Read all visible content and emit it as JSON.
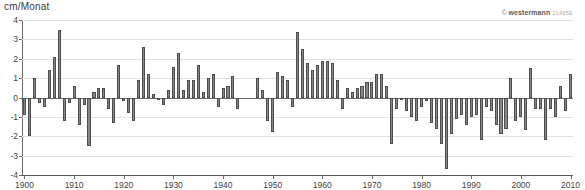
{
  "chart": {
    "y_axis_title": "cm/Monat",
    "copyright_symbol": "©",
    "copyright_brand": "westermann",
    "copyright_code": "21495E"
  },
  "chart_data": {
    "type": "bar",
    "title": "",
    "subtitle": "",
    "xlabel": "",
    "ylabel": "cm/Monat",
    "ylim": [
      -4,
      4
    ],
    "xlim": [
      1900,
      2010
    ],
    "grid": true,
    "legend": null,
    "y_ticks": [
      4,
      3,
      2,
      1,
      0,
      -1,
      -2,
      -3,
      -4
    ],
    "y_tick_labels": [
      "4",
      "3",
      "2",
      "1",
      "0",
      "-1",
      "-2",
      "-3",
      "-4"
    ],
    "x_ticks": [
      1900,
      1910,
      1920,
      1930,
      1940,
      1950,
      1960,
      1970,
      1980,
      1990,
      2000,
      2010
    ],
    "x_tick_labels": [
      "1900",
      "1910",
      "1920",
      "1930",
      "1940",
      "1950",
      "1960",
      "1970",
      "1980",
      "1990",
      "2000",
      "2010"
    ],
    "bar_color": "#878787",
    "bar_edge_color": "#4d4d4d",
    "categories": [
      1900,
      1901,
      1902,
      1903,
      1904,
      1905,
      1906,
      1907,
      1908,
      1909,
      1910,
      1911,
      1912,
      1913,
      1914,
      1915,
      1916,
      1917,
      1918,
      1919,
      1920,
      1921,
      1922,
      1923,
      1924,
      1925,
      1926,
      1927,
      1928,
      1929,
      1930,
      1931,
      1932,
      1933,
      1934,
      1935,
      1936,
      1937,
      1938,
      1939,
      1940,
      1941,
      1942,
      1943,
      1944,
      1945,
      1946,
      1947,
      1948,
      1949,
      1950,
      1951,
      1952,
      1953,
      1954,
      1955,
      1956,
      1957,
      1958,
      1959,
      1960,
      1961,
      1962,
      1963,
      1964,
      1965,
      1966,
      1967,
      1968,
      1969,
      1970,
      1971,
      1972,
      1973,
      1974,
      1975,
      1976,
      1977,
      1978,
      1979,
      1980,
      1981,
      1982,
      1983,
      1984,
      1985,
      1986,
      1987,
      1988,
      1989,
      1990,
      1991,
      1992,
      1993,
      1994,
      1995,
      1996,
      1997,
      1998,
      1999,
      2000,
      2001,
      2002,
      2003,
      2004,
      2005,
      2006,
      2007,
      2008,
      2009,
      2010
    ],
    "values": [
      -0.9,
      -2.0,
      1.0,
      -0.3,
      -0.5,
      1.4,
      2.1,
      3.5,
      -1.2,
      -0.3,
      0.6,
      -1.4,
      -0.4,
      -2.5,
      0.3,
      0.5,
      0.5,
      -0.6,
      -1.3,
      1.7,
      -0.2,
      -0.8,
      -1.2,
      0.9,
      2.6,
      1.2,
      0.2,
      -0.1,
      -0.4,
      0.4,
      1.6,
      2.3,
      0.4,
      0.9,
      0.9,
      1.7,
      0.3,
      1.0,
      1.2,
      -0.5,
      0.5,
      0.6,
      1.1,
      -0.6,
      0.0,
      0.0,
      0.0,
      1.0,
      0.4,
      -1.2,
      -1.8,
      1.3,
      1.1,
      0.9,
      -0.5,
      3.4,
      2.5,
      1.8,
      1.4,
      1.7,
      1.9,
      1.9,
      1.8,
      0.9,
      -0.6,
      0.5,
      0.3,
      0.5,
      0.6,
      0.8,
      0.8,
      1.2,
      1.2,
      0.6,
      -2.4,
      -0.6,
      -0.1,
      -0.7,
      -1.0,
      -1.2,
      -0.5,
      -0.2,
      -1.3,
      -1.6,
      -2.4,
      -3.7,
      -1.9,
      -1.1,
      -0.9,
      -1.4,
      -1.0,
      -0.9,
      -2.2,
      -0.5,
      -0.7,
      -1.4,
      -1.9,
      -1.6,
      1.0,
      -1.2,
      -1.0,
      -1.7,
      1.5,
      -0.6,
      -0.6,
      -2.2,
      -0.6,
      -1.0,
      0.6,
      -0.7,
      1.2
    ]
  }
}
